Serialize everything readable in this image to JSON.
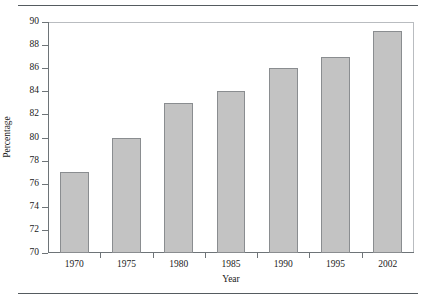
{
  "chart_data": {
    "type": "bar",
    "title": "",
    "subtitle": "",
    "xlabel": "Year",
    "ylabel": "Percentage",
    "categories": [
      "1970",
      "1975",
      "1980",
      "1985",
      "1990",
      "1995",
      "2002"
    ],
    "values": [
      77,
      80,
      83,
      84,
      86,
      87,
      89.2
    ],
    "ylim": [
      70,
      90
    ],
    "yticks": [
      70,
      72,
      74,
      76,
      78,
      80,
      82,
      84,
      86,
      88,
      90
    ],
    "ytick_labels": [
      "70",
      "72",
      "74",
      "76",
      "78",
      "80",
      "82",
      "84",
      "86",
      "88",
      "90"
    ],
    "grid": false,
    "legend": false,
    "legend_position": "none",
    "series": [
      {
        "name": "Percentage",
        "values": [
          77,
          80,
          83,
          84,
          86,
          87,
          89.2
        ]
      }
    ],
    "colors": {
      "bar_fill": "#c3c3c3",
      "bar_border": "#8a8d90",
      "axis": "#6e7478",
      "frame": "#b9bcc0",
      "rule": "#555b60",
      "text": "#1a1a1a",
      "background": "#ffffff"
    }
  },
  "figure": {
    "top_rule": "",
    "bottom_rule": ""
  }
}
